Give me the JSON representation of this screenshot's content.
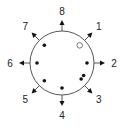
{
  "diagram": {
    "directions": [
      {
        "label": "1",
        "angle_deg": 45
      },
      {
        "label": "2",
        "angle_deg": 0
      },
      {
        "label": "3",
        "angle_deg": -45
      },
      {
        "label": "4",
        "angle_deg": -90
      },
      {
        "label": "5",
        "angle_deg": -135
      },
      {
        "label": "6",
        "angle_deg": 180
      },
      {
        "label": "7",
        "angle_deg": 135
      },
      {
        "label": "8",
        "angle_deg": 90
      }
    ],
    "dots": [
      {
        "angle_deg": 45,
        "filled": false
      },
      {
        "angle_deg": 0,
        "filled": true
      },
      {
        "angle_deg": -30,
        "filled": true
      },
      {
        "angle_deg": -40,
        "filled": true
      },
      {
        "angle_deg": -90,
        "filled": true
      },
      {
        "angle_deg": -135,
        "filled": true
      },
      {
        "angle_deg": 180,
        "filled": true
      },
      {
        "angle_deg": 135,
        "filled": true
      }
    ],
    "colors": {
      "stroke": "#555555",
      "dot": "#111111",
      "label": "#222222"
    }
  }
}
